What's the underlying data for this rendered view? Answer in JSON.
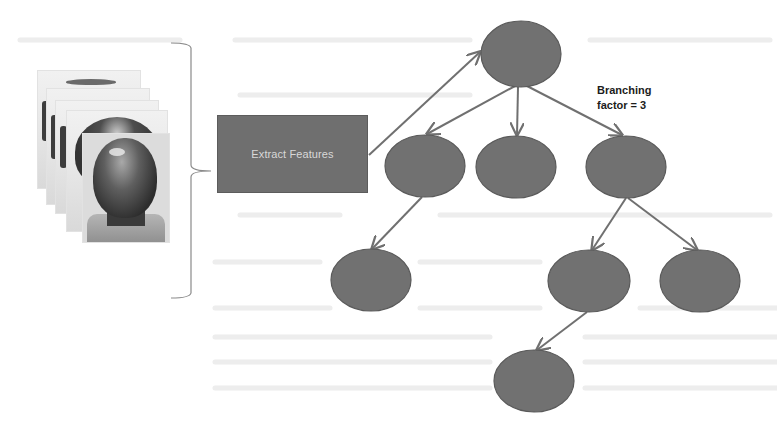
{
  "figure": {
    "background": "#ffffff",
    "input_images": {
      "description": "stack of face image frames",
      "frame_count": 5
    },
    "process_box": {
      "label": "Extract Features",
      "fill": "#6f6f6f",
      "text_color": "#d8d8d8"
    },
    "annotation": {
      "line1": "Branching",
      "line2": "factor = 3"
    },
    "tree": {
      "node_fill": "#717171",
      "node_stroke": "#5a5a5a",
      "edge_color": "#707070",
      "nodes": [
        {
          "id": "root",
          "cx": 521,
          "cy": 54,
          "rx": 40,
          "ry": 33
        },
        {
          "id": "l1-left",
          "cx": 425,
          "cy": 166,
          "rx": 40,
          "ry": 31
        },
        {
          "id": "l1-mid",
          "cx": 516,
          "cy": 167,
          "rx": 40,
          "ry": 31
        },
        {
          "id": "l1-right",
          "cx": 626,
          "cy": 167,
          "rx": 40,
          "ry": 31
        },
        {
          "id": "l2-left",
          "cx": 371,
          "cy": 280,
          "rx": 40,
          "ry": 31
        },
        {
          "id": "l2-mid",
          "cx": 589,
          "cy": 281,
          "rx": 41,
          "ry": 31
        },
        {
          "id": "l2-right",
          "cx": 700,
          "cy": 281,
          "rx": 40,
          "ry": 31
        },
        {
          "id": "l3",
          "cx": 534,
          "cy": 381,
          "rx": 40,
          "ry": 31
        }
      ],
      "edges": [
        {
          "from": "extract-box",
          "to": "root",
          "x1": 369,
          "y1": 155,
          "x2": 480,
          "y2": 52
        },
        {
          "from": "root",
          "to": "l1-left",
          "x1": 515,
          "y1": 86,
          "x2": 427,
          "y2": 134
        },
        {
          "from": "root",
          "to": "l1-mid",
          "x1": 518,
          "y1": 87,
          "x2": 517,
          "y2": 135
        },
        {
          "from": "root",
          "to": "l1-right",
          "x1": 527,
          "y1": 86,
          "x2": 622,
          "y2": 135
        },
        {
          "from": "l1-left",
          "to": "l2-left",
          "x1": 422,
          "y1": 197,
          "x2": 372,
          "y2": 249
        },
        {
          "from": "l1-right",
          "to": "l2-mid",
          "x1": 626,
          "y1": 198,
          "x2": 592,
          "y2": 250
        },
        {
          "from": "l1-right",
          "to": "l2-right",
          "x1": 628,
          "y1": 198,
          "x2": 697,
          "y2": 250
        },
        {
          "from": "l2-mid",
          "to": "l3",
          "x1": 587,
          "y1": 312,
          "x2": 537,
          "y2": 350
        }
      ]
    }
  }
}
